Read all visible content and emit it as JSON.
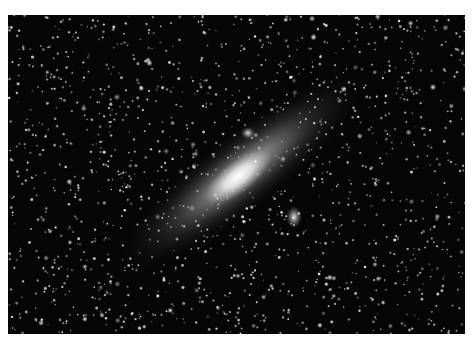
{
  "image": {
    "subject": "Andromeda Galaxy (M31) astrophotograph",
    "colors": {
      "sky": "#050505",
      "star": "#e8e8e8",
      "galaxy_core": "#f4f4f4",
      "galaxy_halo": "#9a9a9a"
    },
    "star_field": {
      "seed": 31,
      "count": 1500
    },
    "galaxy": {
      "name": "M31",
      "orientation": "diagonal, lower-left to upper-right"
    },
    "satellites": [
      {
        "name": "M32",
        "note": "small bright knot above the core"
      },
      {
        "name": "M110",
        "note": "fuzzy oval below-right of the galaxy"
      }
    ]
  }
}
